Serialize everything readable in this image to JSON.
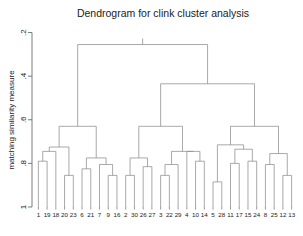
{
  "chart_data": {
    "type": "dendrogram",
    "title": "Dendrogram for clink cluster analysis",
    "xlabel": "",
    "ylabel": "matching similarity measure",
    "yticks": [
      "2",
      "4",
      "6",
      "8",
      "1"
    ],
    "ytick_values": [
      0.2,
      0.4,
      0.6,
      0.8,
      1.0
    ],
    "ytick_labels_display": [
      ".2",
      ".4",
      ".6",
      ".8",
      "1"
    ],
    "ylim": [
      1.0,
      0.17
    ],
    "y_axis_reversed": true,
    "grid": false,
    "legend": null,
    "leaf_order": [
      "1",
      "19",
      "18",
      "20",
      "23",
      "6",
      "21",
      "7",
      "9",
      "16",
      "2",
      "30",
      "26",
      "27",
      "3",
      "22",
      "29",
      "4",
      "10",
      "14",
      "5",
      "28",
      "11",
      "17",
      "15",
      "24",
      "8",
      "25",
      "12",
      "13"
    ],
    "leaf_count": 30,
    "leaf_base_height": 1.0,
    "merges": [
      {
        "id": "m1",
        "left": "1",
        "right": "19",
        "height": 0.79
      },
      {
        "id": "m2",
        "left": "m1",
        "right": "18",
        "height": 0.745
      },
      {
        "id": "m3",
        "left": "20",
        "right": "23",
        "height": 0.855
      },
      {
        "id": "m4",
        "left": "m2",
        "right": "m3",
        "height": 0.725
      },
      {
        "id": "m5",
        "left": "6",
        "right": "21",
        "height": 0.825
      },
      {
        "id": "m6",
        "left": "9",
        "right": "16",
        "height": 0.855
      },
      {
        "id": "m7",
        "left": "7",
        "right": "m6",
        "height": 0.805
      },
      {
        "id": "m8",
        "left": "m5",
        "right": "m7",
        "height": 0.775
      },
      {
        "id": "m9",
        "left": "m4",
        "right": "m8",
        "height": 0.63
      },
      {
        "id": "m10",
        "left": "2",
        "right": "30",
        "height": 0.855
      },
      {
        "id": "m11",
        "left": "26",
        "right": "27",
        "height": 0.815
      },
      {
        "id": "m12",
        "left": "m10",
        "right": "m11",
        "height": 0.775
      },
      {
        "id": "m13",
        "left": "3",
        "right": "22",
        "height": 0.855
      },
      {
        "id": "m14",
        "left": "m13",
        "right": "29",
        "height": 0.805
      },
      {
        "id": "m15",
        "left": "10",
        "right": "14",
        "height": 0.79
      },
      {
        "id": "m16",
        "left": "4",
        "right": "m15",
        "height": 0.745
      },
      {
        "id": "m17",
        "left": "m14",
        "right": "m16",
        "height": 0.745
      },
      {
        "id": "m18",
        "left": "m12",
        "right": "m17",
        "height": 0.63
      },
      {
        "id": "m19",
        "left": "5",
        "right": "28",
        "height": 0.885
      },
      {
        "id": "m20",
        "left": "11",
        "right": "17",
        "height": 0.8
      },
      {
        "id": "m21",
        "left": "15",
        "right": "24",
        "height": 0.79
      },
      {
        "id": "m22",
        "left": "m20",
        "right": "m21",
        "height": 0.735
      },
      {
        "id": "m23",
        "left": "m19",
        "right": "m22",
        "height": 0.715
      },
      {
        "id": "m24",
        "left": "8",
        "right": "25",
        "height": 0.805
      },
      {
        "id": "m25",
        "left": "12",
        "right": "13",
        "height": 0.855
      },
      {
        "id": "m26",
        "left": "m24",
        "right": "m25",
        "height": 0.755
      },
      {
        "id": "m27",
        "left": "m23",
        "right": "m26",
        "height": 0.63
      },
      {
        "id": "m28",
        "left": "m18",
        "right": "m27",
        "height": 0.435
      },
      {
        "id": "m29",
        "left": "m9",
        "right": "m28",
        "height": 0.255
      }
    ],
    "root": "m29"
  },
  "colors": {
    "background": "#ffffff",
    "line": "#8c8c8c",
    "axis": "#5a5a5a",
    "text": "#1a1a1a"
  }
}
